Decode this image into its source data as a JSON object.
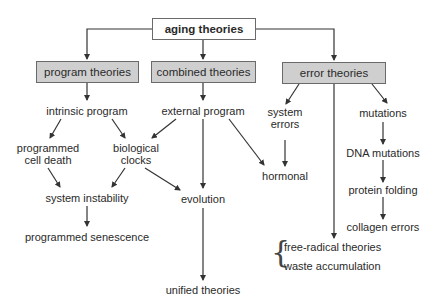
{
  "diagram": {
    "root": {
      "label": "aging theories"
    },
    "categories": [
      {
        "id": "program",
        "label": "program theories"
      },
      {
        "id": "combined",
        "label": "combined theories"
      },
      {
        "id": "error",
        "label": "error theories"
      }
    ],
    "nodes": {
      "intrinsic_program": "intrinsic program",
      "external_program": "external program",
      "system_errors_1": "system",
      "system_errors_2": "errors",
      "mutations": "mutations",
      "programmed_cell_death_1": "programmed",
      "programmed_cell_death_2": "cell death",
      "biological_clocks_1": "biological",
      "biological_clocks_2": "clocks",
      "hormonal": "hormonal",
      "dna_mutations": "DNA mutations",
      "system_instability": "system instability",
      "evolution": "evolution",
      "protein_folding": "protein folding",
      "programmed_senescence": "programmed senescence",
      "collagen_errors": "collagen errors",
      "free_radical_theories": "free-radical theories",
      "waste_accumulation": "waste accumulation",
      "unified_theories": "unified theories"
    },
    "colors": {
      "category_fill": "#cfcfcf",
      "root_fill": "#ffffff",
      "line": "#333333",
      "border": "#6a6a6a"
    }
  }
}
